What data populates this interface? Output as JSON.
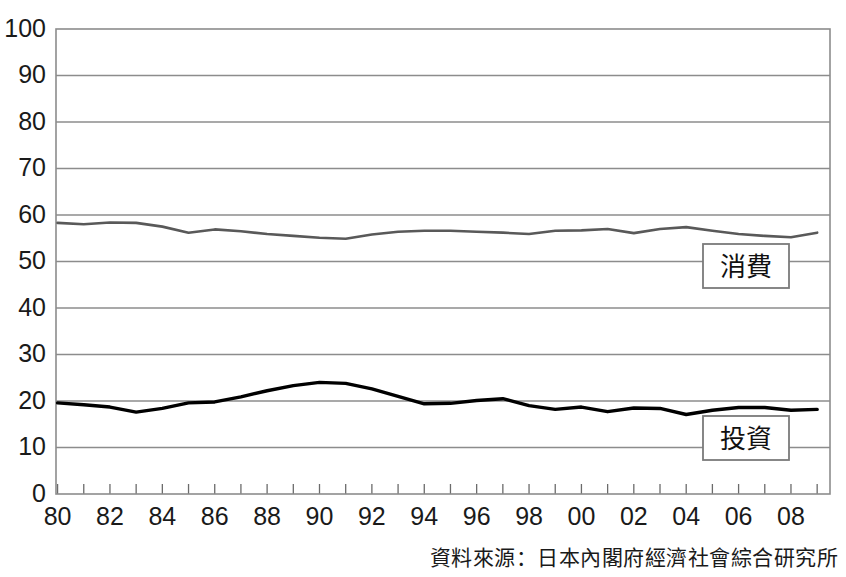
{
  "chart_data": {
    "type": "line",
    "title": "",
    "xlabel": "",
    "ylabel": "",
    "ylim": [
      0,
      100
    ],
    "ytick_values": [
      0,
      10,
      20,
      30,
      40,
      50,
      60,
      70,
      80,
      90,
      100
    ],
    "ytick_labels": [
      "0",
      "10",
      "20",
      "30",
      "40",
      "50",
      "60",
      "70",
      "80",
      "90",
      "100"
    ],
    "grid": true,
    "legend_position": "inline-right",
    "x": [
      1980,
      1981,
      1982,
      1983,
      1984,
      1985,
      1986,
      1987,
      1988,
      1989,
      1990,
      1991,
      1992,
      1993,
      1994,
      1995,
      1996,
      1997,
      1998,
      1999,
      2000,
      2001,
      2002,
      2003,
      2004,
      2005,
      2006,
      2007,
      2008,
      2009
    ],
    "xtick_labels": [
      "80",
      "",
      "82",
      "",
      "84",
      "",
      "86",
      "",
      "88",
      "",
      "90",
      "",
      "92",
      "",
      "94",
      "",
      "96",
      "",
      "98",
      "",
      "00",
      "",
      "02",
      "",
      "04",
      "",
      "06",
      "",
      "08",
      ""
    ],
    "xtick_labels_shown": [
      "80",
      "82",
      "84",
      "86",
      "88",
      "90",
      "92",
      "94",
      "96",
      "98",
      "00",
      "02",
      "04",
      "06",
      "08"
    ],
    "series": [
      {
        "name": "消費",
        "color": "#595959",
        "values": [
          58.3,
          58.0,
          58.4,
          58.3,
          57.5,
          56.2,
          56.9,
          56.5,
          55.9,
          55.5,
          55.1,
          54.9,
          55.8,
          56.4,
          56.6,
          56.6,
          56.4,
          56.2,
          55.9,
          56.6,
          56.7,
          57.0,
          56.1,
          57.0,
          57.4,
          56.6,
          55.9,
          55.5,
          55.2,
          56.2
        ]
      },
      {
        "name": "投資",
        "color": "#000000",
        "values": [
          19.6,
          19.2,
          18.7,
          17.6,
          18.4,
          19.6,
          19.8,
          20.9,
          22.2,
          23.3,
          24.0,
          23.8,
          22.6,
          21.0,
          19.4,
          19.5,
          20.1,
          20.5,
          19.0,
          18.2,
          18.7,
          17.7,
          18.5,
          18.4,
          17.1,
          18.0,
          18.6,
          18.6,
          18.0,
          18.2
        ]
      }
    ]
  },
  "legend": {
    "items": [
      {
        "label": "消費"
      },
      {
        "label": "投資"
      }
    ]
  },
  "footer": {
    "source": "資料來源：日本內閣府經濟社會綜合研究所"
  },
  "colors": {
    "consumption_line": "#595959",
    "investment_line": "#000000",
    "grid": "#8c8c8c",
    "axis": "#6b6b6b",
    "text": "#1a1a1a"
  }
}
